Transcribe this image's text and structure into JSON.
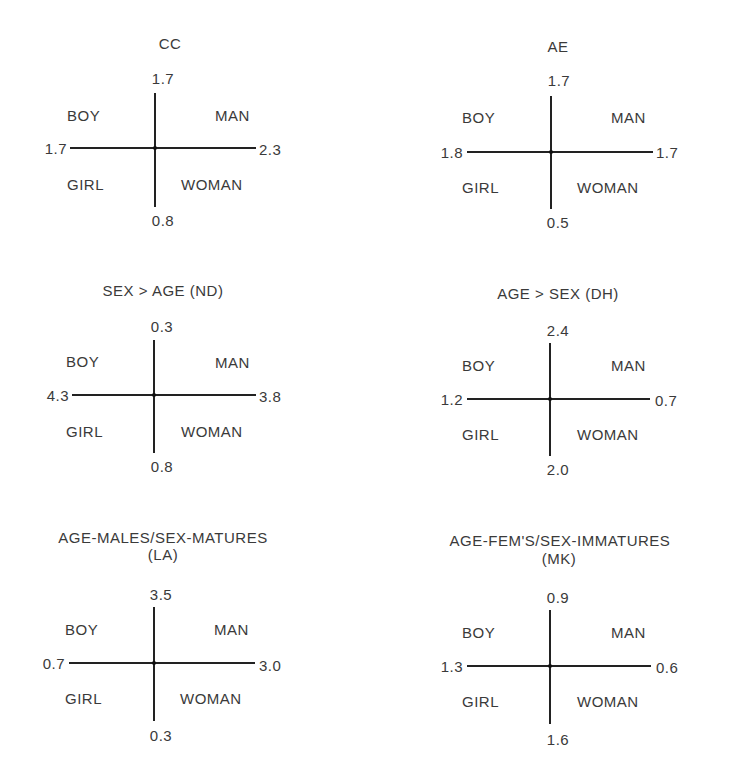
{
  "quadrant_labels": {
    "top_left": "BOY",
    "top_right": "MAN",
    "bottom_left": "GIRL",
    "bottom_right": "WOMAN"
  },
  "panels": [
    {
      "title": "CC",
      "subtitle": "",
      "top": "1.7",
      "bottom": "0.8",
      "left": "1.7",
      "right": "2.3"
    },
    {
      "title": "AE",
      "subtitle": "",
      "top": "1.7",
      "bottom": "0.5",
      "left": "1.8",
      "right": "1.7"
    },
    {
      "title": "SEX  >  AGE (ND)",
      "subtitle": "",
      "top": "0.3",
      "bottom": "0.8",
      "left": "4.3",
      "right": "3.8"
    },
    {
      "title": "AGE  >  SEX (DH)",
      "subtitle": "",
      "top": "2.4",
      "bottom": "2.0",
      "left": "1.2",
      "right": "0.7"
    },
    {
      "title": "AGE-MALES/SEX-MATURES",
      "subtitle": "(LA)",
      "top": "3.5",
      "bottom": "0.3",
      "left": "0.7",
      "right": "3.0"
    },
    {
      "title": "AGE-FEM'S/SEX-IMMATURES",
      "subtitle": "(MK)",
      "top": "0.9",
      "bottom": "1.6",
      "left": "1.3",
      "right": "0.6"
    }
  ]
}
